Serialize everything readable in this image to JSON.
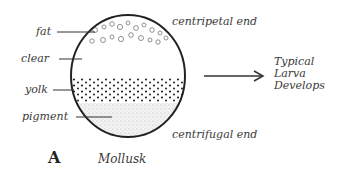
{
  "figure": {
    "panel_letter": "A",
    "caption": "Mollusk",
    "egg_labels": {
      "fat": "fat",
      "clear": "clear",
      "yolk": "yolk",
      "pigment": "pigment"
    },
    "poles": {
      "top": "centripetal end",
      "bottom": "centrifugal end"
    },
    "outcome": {
      "line1": "Typical",
      "line2": "Larva",
      "line3": "Develops"
    }
  }
}
